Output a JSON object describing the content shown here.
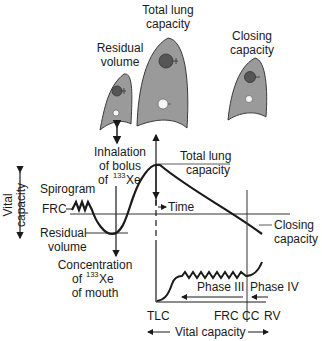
{
  "diagram": {
    "lungs": [
      {
        "label_line1": "Residual",
        "label_line2": "volume"
      },
      {
        "label_line1": "Total lung",
        "label_line2": "capacity"
      },
      {
        "label_line1": "Closing",
        "label_line2": "capacity"
      }
    ],
    "bolus": {
      "line1": "Inhalation",
      "line2": "of bolus",
      "line3_prefix": "of ",
      "superscript": "133",
      "line3_suffix": "Xe"
    },
    "vital_capacity_vertical": {
      "line1": "Vital",
      "line2": "capacity"
    },
    "spirogram": "Spirogram",
    "frc": "FRC",
    "residual_volume": {
      "line1": "Residual",
      "line2": "volume"
    },
    "tlc_label": {
      "line1": "Total lung",
      "line2": "capacity"
    },
    "time": "Time",
    "closing_capacity": {
      "line1": "Closing",
      "line2": "capacity"
    },
    "concentration": {
      "line1": "Concentration",
      "line2_prefix": "of ",
      "superscript": "133",
      "line2_suffix": "Xe",
      "line3": "of mouth"
    },
    "phase3": "Phase III",
    "phase4": "Phase IV",
    "x_ticks": {
      "tlc": "TLC",
      "frc": "FRC",
      "cc": "CC",
      "rv": "RV"
    },
    "vital_capacity_bottom": "Vital capacity",
    "colors": {
      "lung_fill": "#9a9a9a",
      "lung_stroke": "#3a3a3a",
      "dark_alveolus": "#555555",
      "light_alveolus": "#f5f5f5",
      "line": "#1a1a1a"
    }
  }
}
